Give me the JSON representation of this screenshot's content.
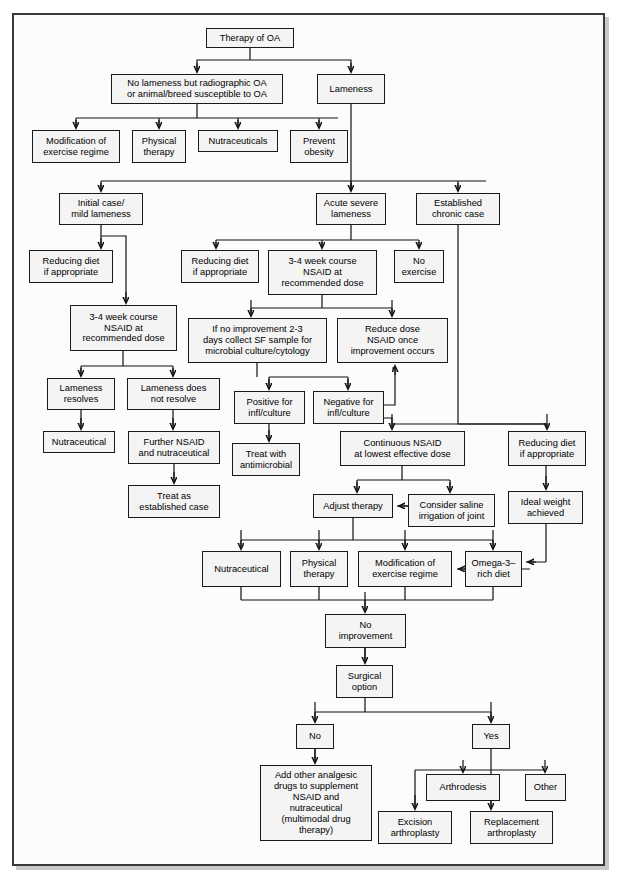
{
  "figure": {
    "kind": "clinical-decision-flowchart",
    "title_node": "Therapy of OA",
    "border_color": "#3a3a3a",
    "node_fill": "#f4f4f4",
    "node_stroke": "#1a1a1a"
  },
  "nodes": [
    {
      "id": "therapy_oa",
      "label": "Therapy of OA",
      "x": 206,
      "y": 28,
      "w": 88,
      "h": 20
    },
    {
      "id": "no_lameness",
      "label": "No lameness but radiographic OA\nor animal/breed susceptible to OA",
      "x": 111,
      "y": 74,
      "w": 172,
      "h": 30
    },
    {
      "id": "lameness",
      "label": "Lameness",
      "x": 317,
      "y": 74,
      "w": 68,
      "h": 30
    },
    {
      "id": "mod_exercise_1",
      "label": "Modification of\nexercise regime",
      "x": 32,
      "y": 130,
      "w": 88,
      "h": 33
    },
    {
      "id": "physical_therapy_1",
      "label": "Physical\ntherapy",
      "x": 132,
      "y": 130,
      "w": 54,
      "h": 33
    },
    {
      "id": "nutraceuticals_1",
      "label": "Nutraceuticals",
      "x": 198,
      "y": 130,
      "w": 80,
      "h": 22
    },
    {
      "id": "prevent_obesity",
      "label": "Prevent\nobesity",
      "x": 290,
      "y": 130,
      "w": 58,
      "h": 33
    },
    {
      "id": "initial_case",
      "label": "Initial case/\nmild lameness",
      "x": 59,
      "y": 193,
      "w": 84,
      "h": 32
    },
    {
      "id": "acute_severe",
      "label": "Acute severe\nlameness",
      "x": 316,
      "y": 193,
      "w": 70,
      "h": 32
    },
    {
      "id": "established",
      "label": "Established\nchronic case",
      "x": 416,
      "y": 193,
      "w": 84,
      "h": 32
    },
    {
      "id": "red_diet_1",
      "label": "Reducing diet\nif appropriate",
      "x": 29,
      "y": 250,
      "w": 84,
      "h": 33
    },
    {
      "id": "red_diet_2",
      "label": "Reducing diet\nif appropriate",
      "x": 181,
      "y": 250,
      "w": 78,
      "h": 33
    },
    {
      "id": "nsaid_course_2",
      "label": "3-4 week course\nNSAID at\nrecommended dose",
      "x": 268,
      "y": 250,
      "w": 109,
      "h": 45
    },
    {
      "id": "no_exercise",
      "label": "No\nexercise",
      "x": 394,
      "y": 250,
      "w": 50,
      "h": 33
    },
    {
      "id": "nsaid_course_1",
      "label": "3-4 week course\nNSAID at\nrecommended dose",
      "x": 70,
      "y": 305,
      "w": 107,
      "h": 46
    },
    {
      "id": "no_improvement_sf",
      "label": "If no improvement 2-3\ndays collect SF sample for\nmicrobial culture/cytology",
      "x": 188,
      "y": 318,
      "w": 139,
      "h": 45
    },
    {
      "id": "reduce_dose",
      "label": "Reduce dose\nNSAID once\nimprovement occurs",
      "x": 337,
      "y": 318,
      "w": 111,
      "h": 45
    },
    {
      "id": "lameness_resolves",
      "label": "Lameness\nresolves",
      "x": 47,
      "y": 378,
      "w": 68,
      "h": 32
    },
    {
      "id": "lameness_not",
      "label": "Lameness does\nnot resolve",
      "x": 127,
      "y": 378,
      "w": 93,
      "h": 32
    },
    {
      "id": "positive_infl",
      "label": "Positive for\ninfl/culture",
      "x": 234,
      "y": 391,
      "w": 71,
      "h": 33
    },
    {
      "id": "negative_infl",
      "label": "Negative for\ninfl/culture",
      "x": 313,
      "y": 391,
      "w": 71,
      "h": 33
    },
    {
      "id": "nutraceutical_2",
      "label": "Nutraceutical",
      "x": 43,
      "y": 431,
      "w": 72,
      "h": 22
    },
    {
      "id": "further_nsaid",
      "label": "Further NSAID\nand nutraceutical",
      "x": 128,
      "y": 431,
      "w": 92,
      "h": 33
    },
    {
      "id": "treat_antimicrob",
      "label": "Treat with\nantimicrobial",
      "x": 232,
      "y": 443,
      "w": 68,
      "h": 33
    },
    {
      "id": "continuous_nsaid",
      "label": "Continuous NSAID\nat lowest effective dose",
      "x": 340,
      "y": 431,
      "w": 125,
      "h": 35
    },
    {
      "id": "red_diet_3",
      "label": "Reducing diet\nif appropriate",
      "x": 508,
      "y": 431,
      "w": 78,
      "h": 35
    },
    {
      "id": "treat_established",
      "label": "Treat as\nestablished case",
      "x": 128,
      "y": 485,
      "w": 92,
      "h": 33
    },
    {
      "id": "adjust_therapy",
      "label": "Adjust therapy",
      "x": 313,
      "y": 494,
      "w": 80,
      "h": 24
    },
    {
      "id": "saline_irrigation",
      "label": "Consider saline\nirrigation of joint",
      "x": 408,
      "y": 494,
      "w": 87,
      "h": 33
    },
    {
      "id": "ideal_weight",
      "label": "Ideal weight\nachieved",
      "x": 508,
      "y": 491,
      "w": 75,
      "h": 33
    },
    {
      "id": "nutraceutical_3",
      "label": "Nutraceutical",
      "x": 202,
      "y": 551,
      "w": 79,
      "h": 36
    },
    {
      "id": "physical_therapy_2",
      "label": "Physical\ntherapy",
      "x": 290,
      "y": 551,
      "w": 58,
      "h": 36
    },
    {
      "id": "mod_exercise_2",
      "label": "Modification of\nexercise regime",
      "x": 358,
      "y": 551,
      "w": 94,
      "h": 36
    },
    {
      "id": "omega3_diet",
      "label": "Omega-3–\nrich diet",
      "x": 465,
      "y": 551,
      "w": 57,
      "h": 36
    },
    {
      "id": "no_improvement",
      "label": "No\nimprovement",
      "x": 325,
      "y": 614,
      "w": 81,
      "h": 34
    },
    {
      "id": "surgical_option",
      "label": "Surgical\noption",
      "x": 336,
      "y": 665,
      "w": 57,
      "h": 33
    },
    {
      "id": "answer_no",
      "label": "No",
      "x": 296,
      "y": 724,
      "w": 38,
      "h": 25
    },
    {
      "id": "answer_yes",
      "label": "Yes",
      "x": 472,
      "y": 724,
      "w": 38,
      "h": 25
    },
    {
      "id": "add_analgesic",
      "label": "Add other analgesic\ndrugs to supplement\nNSAID and\nnutraceutical\n(multimodal drug\ntherapy)",
      "x": 260,
      "y": 765,
      "w": 112,
      "h": 76
    },
    {
      "id": "arthrodesis",
      "label": "Arthrodesis",
      "x": 426,
      "y": 774,
      "w": 74,
      "h": 27
    },
    {
      "id": "other",
      "label": "Other",
      "x": 525,
      "y": 774,
      "w": 41,
      "h": 27
    },
    {
      "id": "excision",
      "label": "Excision\narthroplasty",
      "x": 378,
      "y": 811,
      "w": 74,
      "h": 33
    },
    {
      "id": "replacement",
      "label": "Replacement\narthroplasty",
      "x": 470,
      "y": 811,
      "w": 83,
      "h": 33
    }
  ],
  "edges": [
    {
      "from": "therapy_oa",
      "to": "no_lameness"
    },
    {
      "from": "therapy_oa",
      "to": "lameness"
    },
    {
      "from": "no_lameness",
      "to": "mod_exercise_1"
    },
    {
      "from": "no_lameness",
      "to": "physical_therapy_1"
    },
    {
      "from": "no_lameness",
      "to": "nutraceuticals_1"
    },
    {
      "from": "no_lameness",
      "to": "prevent_obesity"
    },
    {
      "from": "lameness",
      "to": "initial_case"
    },
    {
      "from": "lameness",
      "to": "acute_severe"
    },
    {
      "from": "lameness",
      "to": "established"
    },
    {
      "from": "initial_case",
      "to": "red_diet_1"
    },
    {
      "from": "initial_case",
      "to": "nsaid_course_1"
    },
    {
      "from": "acute_severe",
      "to": "red_diet_2"
    },
    {
      "from": "acute_severe",
      "to": "nsaid_course_2"
    },
    {
      "from": "acute_severe",
      "to": "no_exercise"
    },
    {
      "from": "nsaid_course_2",
      "to": "no_improvement_sf"
    },
    {
      "from": "nsaid_course_2",
      "to": "reduce_dose"
    },
    {
      "from": "nsaid_course_1",
      "to": "lameness_resolves"
    },
    {
      "from": "nsaid_course_1",
      "to": "lameness_not"
    },
    {
      "from": "no_improvement_sf",
      "to": "positive_infl"
    },
    {
      "from": "no_improvement_sf",
      "to": "negative_infl"
    },
    {
      "from": "lameness_resolves",
      "to": "nutraceutical_2"
    },
    {
      "from": "lameness_not",
      "to": "further_nsaid"
    },
    {
      "from": "further_nsaid",
      "to": "treat_established"
    },
    {
      "from": "positive_infl",
      "to": "treat_antimicrob"
    },
    {
      "from": "negative_infl",
      "to": "reduce_dose"
    },
    {
      "from": "negative_infl",
      "to": "continuous_nsaid"
    },
    {
      "from": "established",
      "to": "red_diet_3"
    },
    {
      "from": "continuous_nsaid",
      "to": "adjust_therapy"
    },
    {
      "from": "continuous_nsaid",
      "to": "saline_irrigation"
    },
    {
      "from": "saline_irrigation",
      "to": "adjust_therapy"
    },
    {
      "from": "red_diet_3",
      "to": "ideal_weight"
    },
    {
      "from": "ideal_weight",
      "to": "omega3_diet"
    },
    {
      "from": "adjust_therapy",
      "to": "nutraceutical_3"
    },
    {
      "from": "adjust_therapy",
      "to": "physical_therapy_2"
    },
    {
      "from": "adjust_therapy",
      "to": "mod_exercise_2"
    },
    {
      "from": "adjust_therapy",
      "to": "omega3_diet"
    },
    {
      "from": "omega3_diet",
      "to": "mod_exercise_2"
    },
    {
      "from": "nutraceutical_3",
      "to": "no_improvement"
    },
    {
      "from": "no_improvement",
      "to": "surgical_option"
    },
    {
      "from": "surgical_option",
      "to": "answer_no"
    },
    {
      "from": "surgical_option",
      "to": "answer_yes"
    },
    {
      "from": "answer_no",
      "to": "add_analgesic"
    },
    {
      "from": "answer_yes",
      "to": "arthrodesis"
    },
    {
      "from": "answer_yes",
      "to": "other"
    },
    {
      "from": "answer_yes",
      "to": "excision"
    },
    {
      "from": "answer_yes",
      "to": "replacement"
    }
  ],
  "connector_paths": [
    "M250,48 L250,60 M250,60 L197,60 L197,70 M250,60 L351,60 L351,70",
    "M197,104 L197,118 M76,118 L338,118 M76,118 L76,126 M159,118 L159,126 M238,118 L238,126 M319,118 L319,126",
    "M351,104 L351,189",
    "M101,181 L486,181 M101,181 L101,189 M351,181 L351,189 M458,181 L458,189",
    "M101,225 L101,246 M101,236 L126,236 L126,301",
    "M351,225 L351,240 M216,240 L419,240 M216,240 L216,246 M322,240 L322,246 M419,240 L419,246",
    "M322,295 L322,308 M251,308 L392,308 M251,308 L251,314 M392,308 L392,314",
    "M123,351 L123,366 M81,366 L173,366 M81,366 L81,374 M173,366 L173,374",
    "M81,410 L81,427",
    "M173,410 L173,427",
    "M174,464 L174,481",
    "M257,363 L257,377 M269,377 L348,377 M269,377 L269,387 M348,377 L348,387",
    "M269,424 L269,439",
    "M384,405 L395,405 L395,368 L392,368",
    "M384,418 L392,418 L392,424 M392,424 L547,424 M392,424 L392,427 M547,424 L547,427",
    "M458,225 L458,424 M458,424 L547,424",
    "M402,466 L402,480 M357,480 L450,480 M357,480 L357,490 M450,480 L450,490",
    "M451,506 L397,506",
    "M546,466 L546,487",
    "M546,524 L546,562 M546,562 L526,562",
    "M353,518 L353,540 M241,540 L493,540 M241,540 L241,547 M319,540 L319,547 M405,540 L405,547 M493,540 L493,547",
    "M520,569 L457,569",
    "M241,587 L241,600 M241,600 L493,600 M493,587 L493,600 M405,587 L405,600 M319,587 L319,600 M365,600 L365,610",
    "M365,648 L365,661",
    "M365,698 L365,712 M315,712 L491,712 M315,712 L315,720 M491,712 L491,720",
    "M315,749 L315,761",
    "M491,749 L491,770 M415,770 L545,770 M415,770 L415,807 M463,770 L463,770 M545,770 L545,770 M463,770 L463,770",
    "M491,770 L491,807"
  ]
}
